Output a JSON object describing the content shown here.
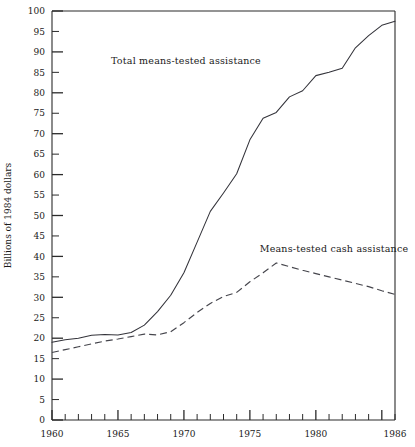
{
  "chart_data": {
    "type": "line",
    "title": "",
    "xlabel": "",
    "ylabel": "Billions of 1984 dollars",
    "xlim": [
      1960,
      1986
    ],
    "ylim": [
      0,
      100
    ],
    "ytick_step": 5,
    "xtick_step": 1,
    "xtick_major_step": 5,
    "grid": false,
    "legend_position": "inline-annotations",
    "ytick_labels": [
      "0",
      "5",
      "10",
      "15",
      "20",
      "25",
      "30",
      "35",
      "40",
      "45",
      "50",
      "55",
      "60",
      "65",
      "70",
      "75",
      "80",
      "85",
      "90",
      "95",
      "100"
    ],
    "ytick_values": [
      0,
      5,
      10,
      15,
      20,
      25,
      30,
      35,
      40,
      45,
      50,
      55,
      60,
      65,
      70,
      75,
      80,
      85,
      90,
      95,
      100
    ],
    "xtick_labels": [
      "1960",
      "1965",
      "1970",
      "1975",
      "1980",
      "1986"
    ],
    "xtick_label_values": [
      1960,
      1965,
      1970,
      1975,
      1980,
      1986
    ],
    "xtick_values": [
      1960,
      1961,
      1962,
      1963,
      1964,
      1965,
      1966,
      1967,
      1968,
      1969,
      1970,
      1971,
      1972,
      1973,
      1974,
      1975,
      1976,
      1977,
      1978,
      1979,
      1980,
      1981,
      1982,
      1983,
      1984,
      1985,
      1986
    ],
    "x": [
      1960,
      1961,
      1962,
      1963,
      1964,
      1965,
      1966,
      1967,
      1968,
      1969,
      1970,
      1971,
      1972,
      1973,
      1974,
      1975,
      1976,
      1977,
      1978,
      1979,
      1980,
      1981,
      1982,
      1983,
      1984,
      1985,
      1986
    ],
    "series": [
      {
        "name": "Total means-tested assistance",
        "style": "solid",
        "color": "#33333a",
        "values": [
          19.0,
          19.6,
          20.0,
          20.7,
          20.9,
          20.8,
          21.4,
          23.2,
          26.5,
          30.5,
          36.0,
          43.5,
          51.0,
          55.5,
          60.2,
          68.5,
          73.8,
          75.2,
          79.0,
          80.5,
          84.2,
          85.0,
          86.0,
          91.0,
          94.0,
          96.5,
          97.5
        ]
      },
      {
        "name": "Means-tested cash assistance",
        "style": "dashed",
        "color": "#45454c",
        "values": [
          16.5,
          17.2,
          17.9,
          18.6,
          19.3,
          19.8,
          20.4,
          21.0,
          20.8,
          21.6,
          23.8,
          26.3,
          28.5,
          30.2,
          31.2,
          33.8,
          36.0,
          38.4,
          37.5,
          36.6,
          35.8,
          35.0,
          34.2,
          33.4,
          32.6,
          31.6,
          30.7
        ]
      }
    ],
    "annotations": [
      {
        "text": "Total means-tested assistance",
        "x_px": 186,
        "y_px": 64,
        "anchor": "middle"
      },
      {
        "text": "Means-tested cash assistance",
        "x_px": 334,
        "y_px": 252,
        "anchor": "middle"
      }
    ]
  },
  "plot_geometry": {
    "left": 52,
    "right": 395,
    "top": 11,
    "bottom": 420
  }
}
